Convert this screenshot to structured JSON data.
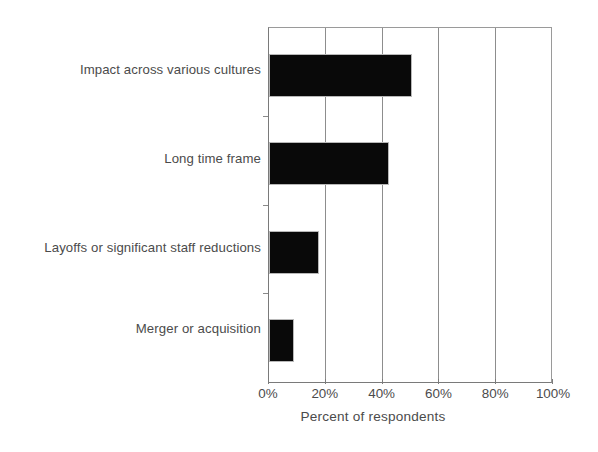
{
  "chart_data": {
    "type": "bar",
    "orientation": "horizontal",
    "title": "",
    "subtitle": "",
    "xlabel": "Percent of respondents",
    "ylabel": "",
    "categories": [
      "Impact across various cultures",
      "Long time frame",
      "Layoffs or significant staff reductions",
      "Merger or acquisition"
    ],
    "values": [
      50,
      42,
      17,
      8
    ],
    "value_labels": [
      "50%",
      "42%",
      "17%",
      "8%"
    ],
    "xlim": [
      0,
      100
    ],
    "xticks": [
      0,
      20,
      40,
      60,
      80,
      100
    ],
    "xtick_labels": [
      "0%",
      "20%",
      "40%",
      "60%",
      "80%",
      "100%"
    ],
    "grid": true,
    "grid_axis": "x",
    "legend": false,
    "bar_color": "#090909",
    "grid_color": "#8d8d8d",
    "axis_color": "#7a7a7a",
    "text_color": "#4b4b4b",
    "background": "#ffffff"
  },
  "axis": {
    "x_title": "Percent of respondents"
  }
}
